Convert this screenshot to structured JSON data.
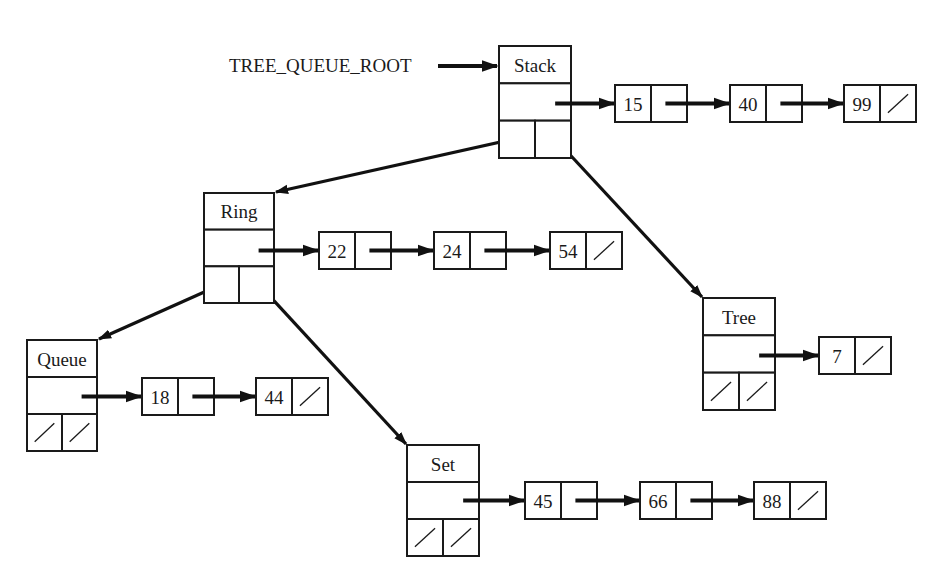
{
  "root_label": "TREE_QUEUE_ROOT",
  "colors": {
    "ink": "#1a1a1a",
    "background": "#ffffff"
  },
  "tree_nodes": [
    {
      "id": "stack",
      "name": "Stack",
      "x": 499,
      "y": 46,
      "w": 72,
      "h": 112,
      "left_child": "ring",
      "right_child": "tree",
      "left_nil": false,
      "right_nil": false,
      "list": [
        {
          "value": "15"
        },
        {
          "value": "40"
        },
        {
          "value": "99",
          "nil": true
        }
      ]
    },
    {
      "id": "ring",
      "name": "Ring",
      "x": 204,
      "y": 193,
      "w": 70,
      "h": 110,
      "left_child": "queue",
      "right_child": "set",
      "left_nil": false,
      "right_nil": false,
      "list": [
        {
          "value": "22"
        },
        {
          "value": "24"
        },
        {
          "value": "54",
          "nil": true
        }
      ]
    },
    {
      "id": "queue",
      "name": "Queue",
      "x": 27,
      "y": 340,
      "w": 70,
      "h": 111,
      "left_child": null,
      "right_child": null,
      "left_nil": true,
      "right_nil": true,
      "list": [
        {
          "value": "18"
        },
        {
          "value": "44",
          "nil": true
        }
      ]
    },
    {
      "id": "tree",
      "name": "Tree",
      "x": 703,
      "y": 298,
      "w": 72,
      "h": 112,
      "left_child": null,
      "right_child": null,
      "left_nil": true,
      "right_nil": true,
      "list": [
        {
          "value": "7",
          "nil": true
        }
      ]
    },
    {
      "id": "set",
      "name": "Set",
      "x": 407,
      "y": 445,
      "w": 72,
      "h": 111,
      "left_child": null,
      "right_child": null,
      "left_nil": true,
      "right_nil": true,
      "list": [
        {
          "value": "45"
        },
        {
          "value": "66"
        },
        {
          "value": "88",
          "nil": true
        }
      ]
    }
  ],
  "list_layouts": {
    "stack": {
      "y": 85,
      "xs": [
        615,
        730,
        844
      ]
    },
    "ring": {
      "y": 232,
      "xs": [
        319,
        434,
        550
      ]
    },
    "queue": {
      "y": 378,
      "xs": [
        142,
        256
      ]
    },
    "tree": {
      "y": 337,
      "xs": [
        819
      ]
    },
    "set": {
      "y": 482,
      "xs": [
        525,
        640,
        754
      ]
    }
  },
  "list_cell": {
    "w": 72,
    "h": 37
  }
}
